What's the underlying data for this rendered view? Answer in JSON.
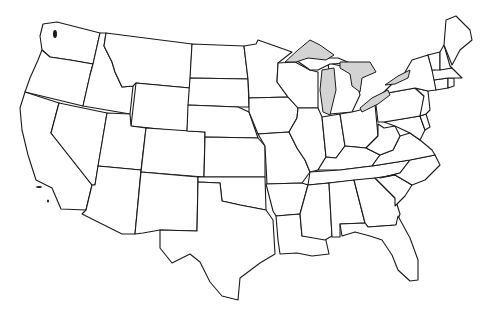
{
  "map": {
    "title": "United States outline map",
    "style": "blank outline",
    "colors": {
      "land": "#ffffff",
      "border": "#1a1a1a",
      "water": "#d3d3d3",
      "background": "#ffffff"
    },
    "regions": [
      "Washington",
      "Oregon",
      "California",
      "Idaho",
      "Nevada",
      "Montana",
      "Wyoming",
      "Utah",
      "Arizona",
      "Colorado",
      "New Mexico",
      "North Dakota",
      "South Dakota",
      "Nebraska",
      "Kansas",
      "Oklahoma",
      "Texas",
      "Minnesota",
      "Iowa",
      "Missouri",
      "Arkansas",
      "Louisiana",
      "Wisconsin",
      "Illinois",
      "Michigan",
      "Indiana",
      "Ohio",
      "Kentucky",
      "Tennessee",
      "Mississippi",
      "Alabama",
      "Georgia",
      "Florida",
      "South Carolina",
      "North Carolina",
      "Virginia",
      "West Virginia",
      "Maryland",
      "Delaware",
      "Pennsylvania",
      "New Jersey",
      "New York",
      "Connecticut",
      "Rhode Island",
      "Massachusetts",
      "Vermont",
      "New Hampshire",
      "Maine"
    ],
    "lakes": [
      "Lake Superior",
      "Lake Michigan",
      "Lake Huron",
      "Lake Erie",
      "Lake Ontario"
    ]
  }
}
